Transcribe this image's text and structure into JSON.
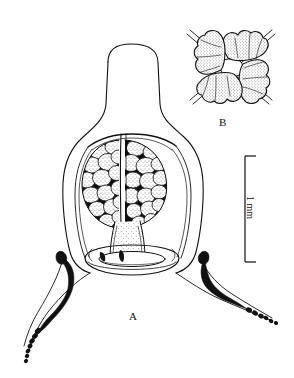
{
  "figure": {
    "type": "scientific-line-drawing",
    "background_color": "#ffffff",
    "ink_color": "#111111",
    "panels": [
      {
        "id": "A",
        "label": "A",
        "description": "lateral view of medusa bell with gonads, manubrium, velum and tentacles"
      },
      {
        "id": "B",
        "label": "B",
        "description": "four-lobed gonad cross section with crossing radial canals"
      }
    ],
    "scalebar": {
      "label": "1 mm",
      "orientation": "vertical",
      "x": 245,
      "y_top": 156,
      "y_bottom": 262
    }
  },
  "panel_a": {
    "label": "A",
    "parts": [
      {
        "name": "exumbrella",
        "label": "bell"
      },
      {
        "name": "gonad-left",
        "label": "left gonad cluster"
      },
      {
        "name": "gonad-right",
        "label": "right gonad cluster"
      },
      {
        "name": "manubrium",
        "label": "manubrium"
      },
      {
        "name": "velum",
        "label": "velum ring"
      },
      {
        "name": "tentacle-left",
        "label": "left tentacle"
      },
      {
        "name": "tentacle-right",
        "label": "right tentacle"
      },
      {
        "name": "tentacle-bulb-left",
        "label": "left tentacle bulb"
      },
      {
        "name": "tentacle-bulb-right",
        "label": "right tentacle bulb"
      }
    ]
  },
  "panel_b": {
    "label": "B",
    "lobes": 4,
    "crossing_lines": 2
  }
}
